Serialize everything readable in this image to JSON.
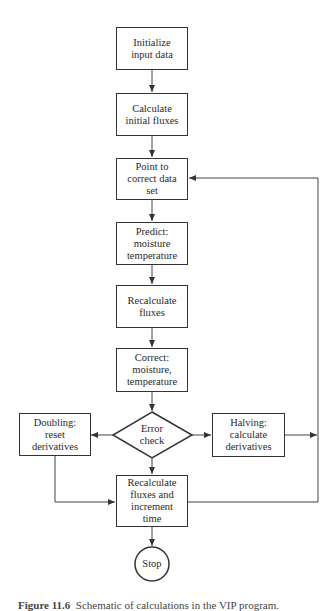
{
  "diagram": {
    "type": "flowchart",
    "nodes": [
      {
        "id": "init",
        "shape": "rect",
        "label": "Initialize\ninput\ndata"
      },
      {
        "id": "calc_init",
        "shape": "rect",
        "label": "Calculate\ninitial fluxes"
      },
      {
        "id": "point",
        "shape": "rect",
        "label": "Point to\ncorrect\ndata set"
      },
      {
        "id": "predict",
        "shape": "rect",
        "label": "Predict:\nmoisture\ntemperature"
      },
      {
        "id": "recalc",
        "shape": "rect",
        "label": "Recalculate\nfluxes"
      },
      {
        "id": "correct",
        "shape": "rect",
        "label": "Correct:\nmoisture,\ntemperature"
      },
      {
        "id": "error",
        "shape": "diamond",
        "label": "Error\ncheck"
      },
      {
        "id": "doubling",
        "shape": "rect",
        "label": "Doubling:\nreset\nderivatives"
      },
      {
        "id": "halving",
        "shape": "rect",
        "label": "Halving:\ncalculate\nderivatives"
      },
      {
        "id": "recalc_inc",
        "shape": "rect",
        "label": "Recalculate\nfluxes and\nincrement\ntime"
      },
      {
        "id": "stop",
        "shape": "circle",
        "label": "Stop"
      }
    ],
    "edges": [
      {
        "from": "init",
        "to": "calc_init"
      },
      {
        "from": "calc_init",
        "to": "point"
      },
      {
        "from": "point",
        "to": "predict"
      },
      {
        "from": "predict",
        "to": "recalc"
      },
      {
        "from": "recalc",
        "to": "correct"
      },
      {
        "from": "correct",
        "to": "error"
      },
      {
        "from": "error",
        "to": "doubling"
      },
      {
        "from": "error",
        "to": "halving"
      },
      {
        "from": "error",
        "to": "recalc_inc"
      },
      {
        "from": "doubling",
        "to": "recalc_inc"
      },
      {
        "from": "halving",
        "to": "point"
      },
      {
        "from": "recalc_inc",
        "to": "point"
      },
      {
        "from": "recalc_inc",
        "to": "stop"
      }
    ]
  },
  "labels": {
    "init": "Initialize input data",
    "calc_init": "Calculate initial fluxes",
    "point": "Point to correct data set",
    "predict": "Predict: moisture temperature",
    "recalc": "Recalculate fluxes",
    "correct": "Correct: moisture, temperature",
    "error": "Error check",
    "doubling": "Doubling: reset derivatives",
    "halving": "Halving: calculate derivatives",
    "recalc_inc": "Recalculate fluxes and increment time",
    "stop": "Stop"
  },
  "caption": {
    "number": "Figure 11.6",
    "text": "Schematic of calculations in the VIP program."
  }
}
